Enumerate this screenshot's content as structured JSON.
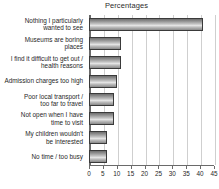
{
  "chart_data": {
    "type": "bar",
    "orientation": "horizontal",
    "title": "Percentages",
    "xlabel": "",
    "ylabel": "",
    "xlim": [
      0,
      45
    ],
    "xticks": [
      0,
      5,
      10,
      15,
      20,
      25,
      30,
      35,
      40,
      45
    ],
    "grid": true,
    "legend": false,
    "categories": [
      "Nothing I particularly wanted to see",
      "Museums are boring places",
      "I find it difficult to get out / health reasons",
      "Admission charges too high",
      "Poor local transport / too far to travel",
      "Not open when I have time to visit",
      "My children wouldn't be interested",
      "No time / too busy"
    ],
    "category_lines": [
      [
        "Nothing I particularly",
        "wanted to see"
      ],
      [
        "Museums are boring",
        "places"
      ],
      [
        "I find it difficult to get out /",
        "health reasons"
      ],
      [
        "Admission charges too high"
      ],
      [
        "Poor local transport /",
        "too far to travel"
      ],
      [
        "Not open when I have",
        "time to visit"
      ],
      [
        "My children wouldn't",
        "be interested"
      ],
      [
        "No time / too busy"
      ]
    ],
    "values": [
      41,
      11.5,
      11.5,
      10,
      9,
      9,
      6.5,
      6.5
    ],
    "colors": {
      "bar_fill_light": "#e6e6e6",
      "bar_fill_dark": "#6e6e6e",
      "bar_border": "#3a3a3a",
      "gridline": "#cfcfcf",
      "axis": "#6a6a6a",
      "text": "#1f1f1f",
      "background": "#ffffff"
    }
  }
}
